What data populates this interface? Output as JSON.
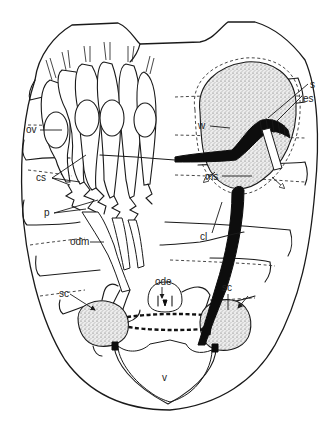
{
  "figure": {
    "type": "anatomical line drawing"
  },
  "labels": {
    "ov": "ov",
    "cs": "cs",
    "p": "p",
    "odm": "odm",
    "ode": "ode",
    "sc_left": "sc",
    "sc_right": "sc",
    "v": "v",
    "cl": "cl",
    "ms": "ms",
    "w": "w",
    "s": "s",
    "es": "es"
  },
  "colors": {
    "ink": "#1a1a1a",
    "background": "#ffffff",
    "solid_structure": "#0d0d0d"
  }
}
